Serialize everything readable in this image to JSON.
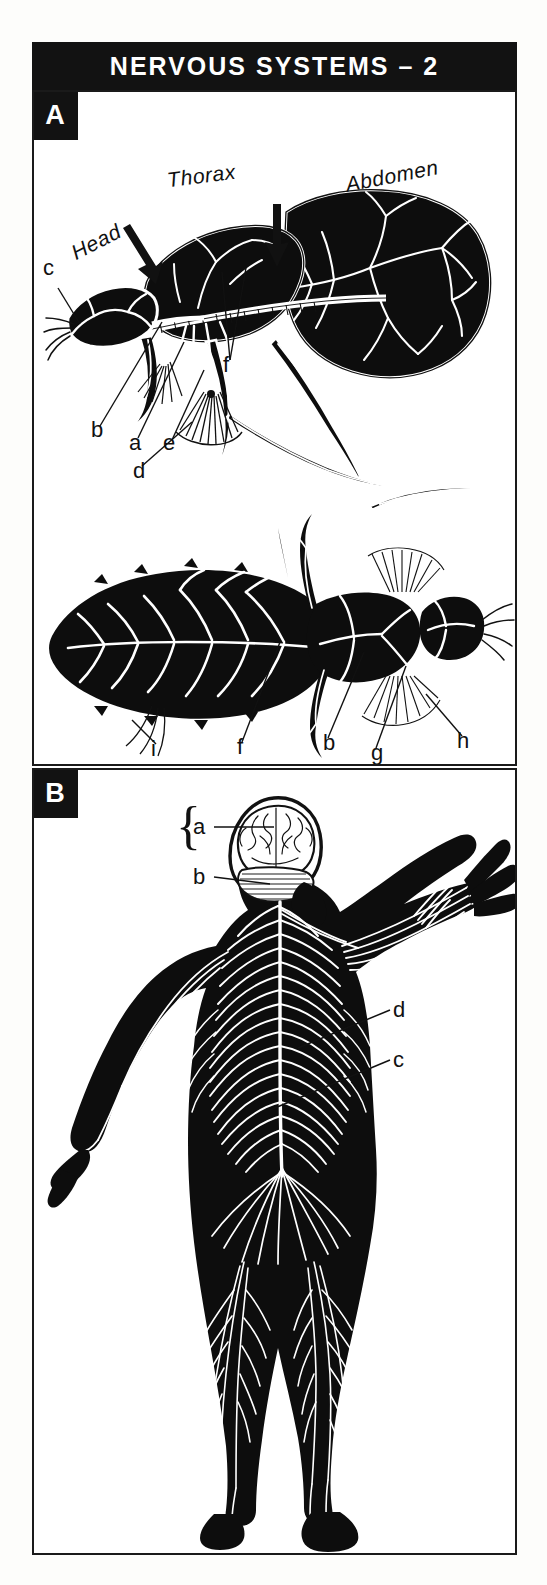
{
  "page": {
    "title": "NERVOUS SYSTEMS – 2",
    "background": "#fdfdfb",
    "plate_background": "#ffffff",
    "ink_color": "#121212"
  },
  "panels": [
    {
      "id": "A",
      "badge": "A",
      "subject": "insect nervous system",
      "region_labels": [
        {
          "key": "head",
          "text": "Head"
        },
        {
          "key": "thorax",
          "text": "Thorax"
        },
        {
          "key": "abdomen",
          "text": "Abdomen"
        }
      ],
      "figure_lateral_keys": [
        {
          "key": "c",
          "text": "c"
        },
        {
          "key": "b",
          "text": "b"
        },
        {
          "key": "a",
          "text": "a"
        },
        {
          "key": "e",
          "text": "e"
        },
        {
          "key": "d",
          "text": "d"
        },
        {
          "key": "f",
          "text": "f"
        }
      ],
      "figure_dorsal_keys": [
        {
          "key": "i",
          "text": "i"
        },
        {
          "key": "f",
          "text": "f"
        },
        {
          "key": "b",
          "text": "b"
        },
        {
          "key": "g",
          "text": "g"
        },
        {
          "key": "h",
          "text": "h"
        }
      ]
    },
    {
      "id": "B",
      "badge": "B",
      "subject": "human nervous system",
      "keys": [
        {
          "key": "a",
          "text": "a"
        },
        {
          "key": "b",
          "text": "b"
        },
        {
          "key": "d",
          "text": "d"
        },
        {
          "key": "c",
          "text": "c"
        }
      ]
    }
  ],
  "icons": {
    "arrow_head": "down-arrow-icon",
    "arrow_thorax": "down-arrow-icon",
    "brace": "curly-brace-icon"
  }
}
